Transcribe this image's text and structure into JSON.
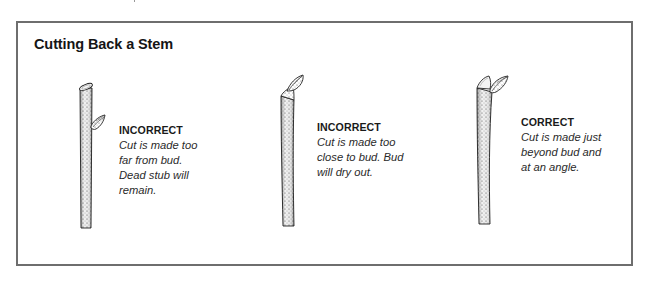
{
  "figure": {
    "title": "Cutting Back a Stem",
    "border_color": "#6e6e6e",
    "panels": [
      {
        "id": "panel-1",
        "verdict": "INCORRECT",
        "description": "Cut is made too\nfar from bud.\nDead stub will\nremain.",
        "illustration": "stem-cut-far-from-bud"
      },
      {
        "id": "panel-2",
        "verdict": "INCORRECT",
        "description": "Cut is made too\nclose to bud. Bud\nwill dry out.",
        "illustration": "stem-cut-close-to-bud"
      },
      {
        "id": "panel-3",
        "verdict": "CORRECT",
        "description": "Cut is made just\nbeyond bud and\nat an angle.",
        "illustration": "stem-cut-correct-angle"
      }
    ]
  }
}
